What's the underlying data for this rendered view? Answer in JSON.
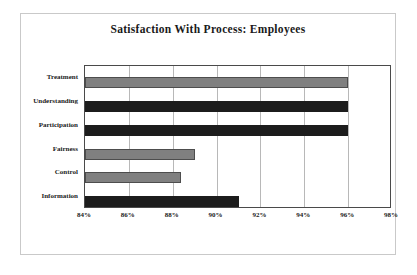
{
  "figure": {
    "title": "Satisfaction With Process: Employees"
  },
  "axis": {
    "ticks": [
      "84%",
      "86%",
      "88%",
      "90%",
      "92%",
      "94%",
      "96%",
      "98%"
    ]
  },
  "categories": [
    "Treatment",
    "Understanding",
    "Participation",
    "Fairness",
    "Control",
    "Information"
  ],
  "colors": {
    "bar_gray": "#808080",
    "bar_dark": "#1c1c1c",
    "frame": "#c9c9c9",
    "plot_border": "#4a4a4a",
    "gridline": "#b8b8b8",
    "text": "#1a1a1a"
  },
  "chart_data": {
    "type": "bar",
    "orientation": "horizontal",
    "title": "Satisfaction With Process: Employees",
    "xlabel": "",
    "ylabel": "",
    "xlim": [
      84,
      98
    ],
    "xtick_values": [
      84,
      86,
      88,
      90,
      92,
      94,
      96,
      98
    ],
    "xtick_labels": [
      "84%",
      "86%",
      "88%",
      "90%",
      "92%",
      "94%",
      "96%",
      "98%"
    ],
    "categories": [
      "Treatment",
      "Understanding",
      "Participation",
      "Fairness",
      "Control",
      "Information"
    ],
    "values": [
      96,
      96,
      96,
      89,
      88.4,
      91
    ],
    "value_labels": [
      "96%",
      "96%",
      "96%",
      "89%",
      "88%",
      "91%"
    ],
    "bar_fills": [
      "gray",
      "dark",
      "dark",
      "gray",
      "gray",
      "dark"
    ],
    "grid": "vertical",
    "legend": "none",
    "units": "percent"
  }
}
